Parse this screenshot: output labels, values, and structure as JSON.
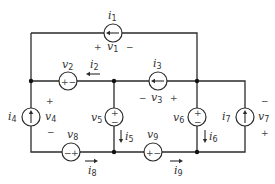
{
  "diagram": {
    "type": "circuit",
    "colors": {
      "wire": "#2b2b2b",
      "text": "#333333",
      "background": "#ffffff"
    },
    "labels": {
      "i1": "i",
      "i1_sub": "1",
      "v1": "v",
      "v1_sub": "1",
      "v2": "v",
      "v2_sub": "2",
      "i2": "i",
      "i2_sub": "2",
      "i3": "i",
      "i3_sub": "3",
      "v3": "v",
      "v3_sub": "3",
      "i4": "i",
      "i4_sub": "4",
      "v4": "v",
      "v4_sub": "4",
      "v5": "v",
      "v5_sub": "5",
      "i5": "i",
      "i5_sub": "5",
      "v6": "v",
      "v6_sub": "6",
      "i6": "i",
      "i6_sub": "6",
      "i7": "i",
      "i7_sub": "7",
      "v7": "v",
      "v7_sub": "7",
      "v8": "v",
      "v8_sub": "8",
      "i8": "i",
      "i8_sub": "8",
      "v9": "v",
      "v9_sub": "9",
      "i9": "i",
      "i9_sub": "9"
    },
    "signs": {
      "plus": "+",
      "minus": "−"
    },
    "elements": [
      {
        "id": "i1",
        "kind": "current-source",
        "direction": "left"
      },
      {
        "id": "v2",
        "kind": "voltage-source",
        "polarity": "+ left, − right"
      },
      {
        "id": "i3",
        "kind": "current-source",
        "direction": "left"
      },
      {
        "id": "i4",
        "kind": "current-source",
        "direction": "up"
      },
      {
        "id": "v5",
        "kind": "voltage-source",
        "polarity": "+ top, − bottom"
      },
      {
        "id": "v6",
        "kind": "voltage-source",
        "polarity": "+ top, − bottom"
      },
      {
        "id": "i7",
        "kind": "current-source",
        "direction": "up"
      },
      {
        "id": "v8",
        "kind": "voltage-source",
        "polarity": "− left, + right"
      },
      {
        "id": "v9",
        "kind": "voltage-source",
        "polarity": "+ left, − right"
      }
    ]
  }
}
